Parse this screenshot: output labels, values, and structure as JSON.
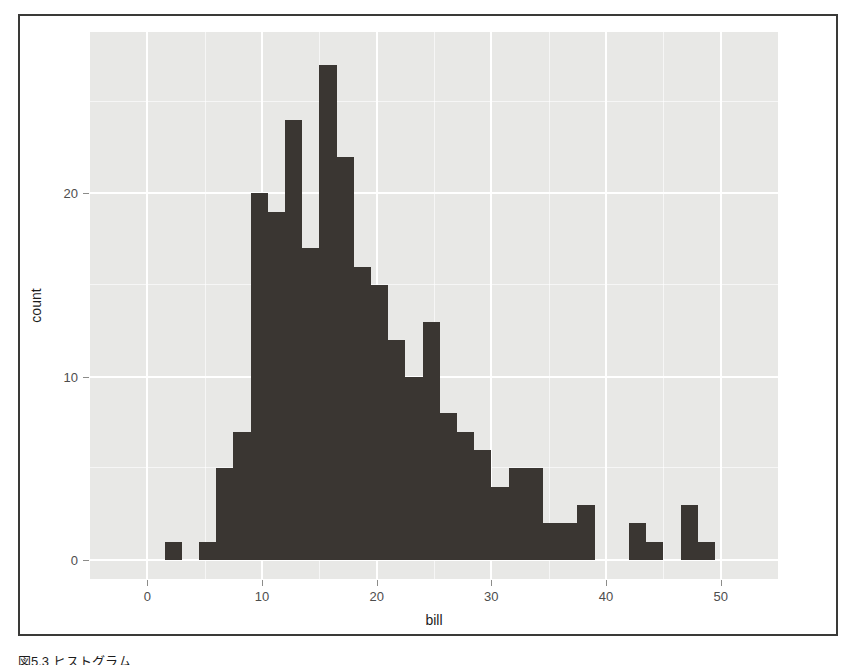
{
  "figure": {
    "caption": "図5.3 ヒストグラム",
    "panel_background": "#e8e8e6",
    "bar_color": "#3a3632",
    "grid_color": "#ffffff",
    "frame_color": "#3a3a38"
  },
  "axes": {
    "x": {
      "label": "bill",
      "ticks": [
        0,
        10,
        20,
        30,
        40,
        50
      ],
      "tick_labels": [
        "0",
        "10",
        "20",
        "30",
        "40",
        "50"
      ],
      "minor_ticks": [
        5,
        15,
        25,
        35,
        45
      ],
      "range": [
        -5,
        55
      ]
    },
    "y": {
      "label": "count",
      "ticks": [
        0,
        10,
        20
      ],
      "tick_labels": [
        "0",
        "10",
        "20"
      ],
      "minor_ticks": [
        5,
        15,
        25
      ],
      "range": [
        0,
        28.8
      ]
    }
  },
  "chart_data": {
    "type": "bar",
    "title": "",
    "subtitle": "",
    "xlabel": "bill",
    "ylabel": "count",
    "xlim": [
      -5,
      55
    ],
    "ylim": [
      0,
      28.8
    ],
    "grid": true,
    "legend": "none",
    "binwidth": 1.5,
    "categories": [
      "2.25",
      "3.75",
      "5.25",
      "6.75",
      "8.25",
      "9.75",
      "11.25",
      "12.75",
      "14.25",
      "15.75",
      "17.25",
      "18.75",
      "20.25",
      "21.75",
      "23.25",
      "24.75",
      "26.25",
      "27.75",
      "29.25",
      "30.75",
      "32.25",
      "33.75",
      "35.25",
      "36.75",
      "38.25",
      "39.75",
      "41.25",
      "42.75",
      "44.25",
      "45.75",
      "47.25",
      "48.75",
      "50.25"
    ],
    "bin_starts": [
      1.5,
      3.0,
      4.5,
      6.0,
      7.5,
      9.0,
      10.5,
      12.0,
      13.5,
      15.0,
      16.5,
      18.0,
      19.5,
      21.0,
      22.5,
      24.0,
      25.5,
      27.0,
      28.5,
      30.0,
      31.5,
      33.0,
      34.5,
      36.0,
      37.5,
      39.0,
      40.5,
      42.0,
      43.5,
      45.0,
      46.5,
      48.0,
      49.5
    ],
    "values": [
      1,
      0,
      1,
      5,
      7,
      20,
      19,
      24,
      17,
      27,
      22,
      16,
      15,
      12,
      10,
      13,
      8,
      7,
      6,
      4,
      5,
      5,
      2,
      2,
      3,
      0,
      0,
      2,
      1,
      0,
      3,
      1,
      0
    ],
    "x": [
      2.25,
      3.75,
      5.25,
      6.75,
      8.25,
      9.75,
      11.25,
      12.75,
      14.25,
      15.75,
      17.25,
      18.75,
      20.25,
      21.75,
      23.25,
      24.75,
      26.25,
      27.75,
      29.25,
      30.75,
      32.25,
      33.75,
      35.25,
      36.75,
      38.25,
      39.75,
      41.25,
      42.75,
      44.25,
      45.75,
      47.25,
      48.75,
      50.25
    ]
  }
}
